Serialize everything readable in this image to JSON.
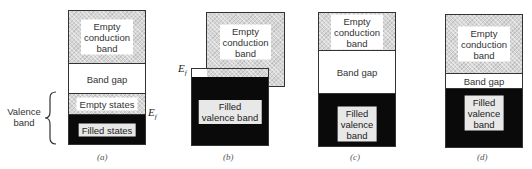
{
  "panels": {
    "a": {
      "caption": "(a)",
      "conduction": "Empty conduction band",
      "conduction_lines": [
        "Empty",
        "conduction",
        "band"
      ],
      "gap": "Band gap",
      "empty_states": "Empty states",
      "filled_states": "Filled states",
      "fermi_label": "E",
      "fermi_sub": "f",
      "side_label_lines": [
        "Valence",
        "band"
      ]
    },
    "b": {
      "caption": "(b)",
      "conduction_lines": [
        "Empty",
        "conduction",
        "band"
      ],
      "valence_lines": [
        "Filled",
        "valence band"
      ],
      "fermi_label": "E",
      "fermi_sub": "f"
    },
    "c": {
      "caption": "(c)",
      "conduction_lines": [
        "Empty",
        "conduction",
        "band"
      ],
      "gap": "Band gap",
      "valence_lines": [
        "Filled",
        "valence",
        "band"
      ]
    },
    "d": {
      "caption": "(d)",
      "conduction_lines": [
        "Empty",
        "conduction",
        "band"
      ],
      "gap": "Band gap",
      "valence_lines": [
        "Filled",
        "valence",
        "band"
      ]
    }
  },
  "colors": {
    "filled": "#0a0a0a",
    "empty_hatch": "#d6d6d6",
    "gap": "#ffffff"
  }
}
